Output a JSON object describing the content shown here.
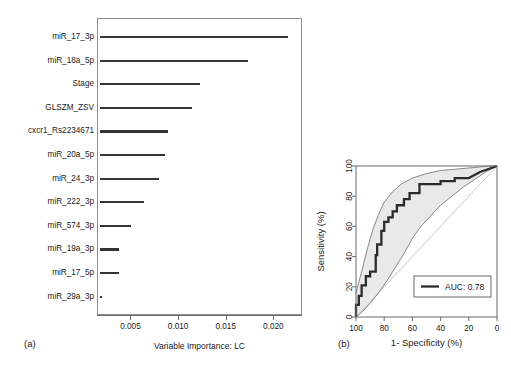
{
  "figure": {
    "panel_a_tag": "(a)",
    "panel_b_tag": "(b)"
  },
  "chart_data": [
    {
      "type": "bar",
      "orientation": "horizontal",
      "panel": "(a)",
      "title": "",
      "xlabel": "Variable Importance: LC",
      "ylabel": "",
      "xlim": [
        0.0018,
        0.0228
      ],
      "xticks": [
        0.005,
        0.01,
        0.015,
        0.02
      ],
      "xtick_labels": [
        "0.005",
        "0.010",
        "0.015",
        "0.020"
      ],
      "grid": false,
      "legend": null,
      "categories": [
        "miR_17_3p",
        "miR_18a_5p",
        "Stage",
        "GLSZM_ZSV",
        "cxcr1_Rs2234671",
        "miR_20a_5p",
        "miR_24_3p",
        "miR_222_3p",
        "miR_574_3p",
        "miR_19a_3p",
        "miR_17_5p",
        "miR_29a_3p"
      ],
      "values": [
        0.0215,
        0.0173,
        0.0123,
        0.0115,
        0.0089,
        0.0086,
        0.008,
        0.0064,
        0.0051,
        0.0038,
        0.0038,
        0.002
      ]
    },
    {
      "type": "line",
      "subtype": "roc",
      "panel": "(b)",
      "title": "",
      "xlabel": "1- Specificity (%)",
      "ylabel": "Sensitivity (%)",
      "xlim": [
        100,
        0
      ],
      "ylim": [
        0,
        100
      ],
      "x_reversed": true,
      "xticks": [
        100,
        80,
        60,
        40,
        20,
        0
      ],
      "xtick_labels": [
        "100",
        "80",
        "60",
        "40",
        "20",
        "0"
      ],
      "yticks": [
        0,
        20,
        40,
        60,
        80,
        100
      ],
      "ytick_labels": [
        "0",
        "20",
        "40",
        "60",
        "80",
        "100"
      ],
      "grid": false,
      "auc": 0.78,
      "legend": {
        "position": "bottom-right",
        "entries": [
          {
            "label": "AUC: 0.78",
            "marker": "line",
            "color": "#2b2b2b"
          }
        ]
      },
      "series": [
        {
          "name": "ROC curve",
          "color": "#2b2b2b",
          "points": [
            [
              100,
              0
            ],
            [
              100,
              8
            ],
            [
              98,
              8
            ],
            [
              98,
              14
            ],
            [
              96,
              14
            ],
            [
              96,
              21
            ],
            [
              93,
              21
            ],
            [
              93,
              27
            ],
            [
              90,
              27
            ],
            [
              90,
              30
            ],
            [
              86,
              30
            ],
            [
              86,
              41
            ],
            [
              85,
              41
            ],
            [
              85,
              48
            ],
            [
              82,
              48
            ],
            [
              82,
              57
            ],
            [
              80,
              57
            ],
            [
              80,
              63
            ],
            [
              77,
              63
            ],
            [
              77,
              66
            ],
            [
              74,
              66
            ],
            [
              74,
              70
            ],
            [
              71,
              70
            ],
            [
              71,
              74
            ],
            [
              66,
              74
            ],
            [
              66,
              78
            ],
            [
              62,
              78
            ],
            [
              62,
              82
            ],
            [
              55,
              82
            ],
            [
              55,
              88
            ],
            [
              40,
              88
            ],
            [
              40,
              90
            ],
            [
              30,
              90
            ],
            [
              30,
              92
            ],
            [
              20,
              92
            ],
            [
              12,
              96
            ],
            [
              6,
              98
            ],
            [
              0,
              100
            ]
          ]
        },
        {
          "name": "Confidence band upper",
          "color": "#7a7a7a",
          "points": [
            [
              100,
              16
            ],
            [
              96,
              30
            ],
            [
              92,
              45
            ],
            [
              88,
              58
            ],
            [
              84,
              68
            ],
            [
              80,
              76
            ],
            [
              74,
              83
            ],
            [
              68,
              88
            ],
            [
              60,
              92
            ],
            [
              50,
              95
            ],
            [
              40,
              97
            ],
            [
              28,
              98
            ],
            [
              16,
              99
            ],
            [
              6,
              100
            ],
            [
              0,
              100
            ]
          ]
        },
        {
          "name": "Confidence band lower",
          "color": "#7a7a7a",
          "points": [
            [
              100,
              0
            ],
            [
              96,
              3
            ],
            [
              90,
              9
            ],
            [
              84,
              16
            ],
            [
              78,
              24
            ],
            [
              72,
              33
            ],
            [
              66,
              42
            ],
            [
              60,
              52
            ],
            [
              54,
              60
            ],
            [
              48,
              66
            ],
            [
              40,
              74
            ],
            [
              32,
              80
            ],
            [
              24,
              86
            ],
            [
              16,
              91
            ],
            [
              8,
              96
            ],
            [
              0,
              100
            ]
          ]
        },
        {
          "name": "Reference diagonal",
          "color": "#c9c9c9",
          "points": [
            [
              100,
              0
            ],
            [
              0,
              100
            ]
          ]
        }
      ]
    }
  ]
}
